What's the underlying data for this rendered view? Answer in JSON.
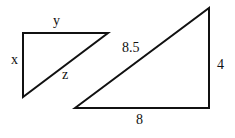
{
  "diagram": {
    "small_triangle": {
      "labels": {
        "top": "y",
        "left": "x",
        "hypotenuse": "z"
      }
    },
    "large_triangle": {
      "labels": {
        "hypotenuse": "8.5",
        "right": "4",
        "bottom": "8"
      }
    }
  }
}
